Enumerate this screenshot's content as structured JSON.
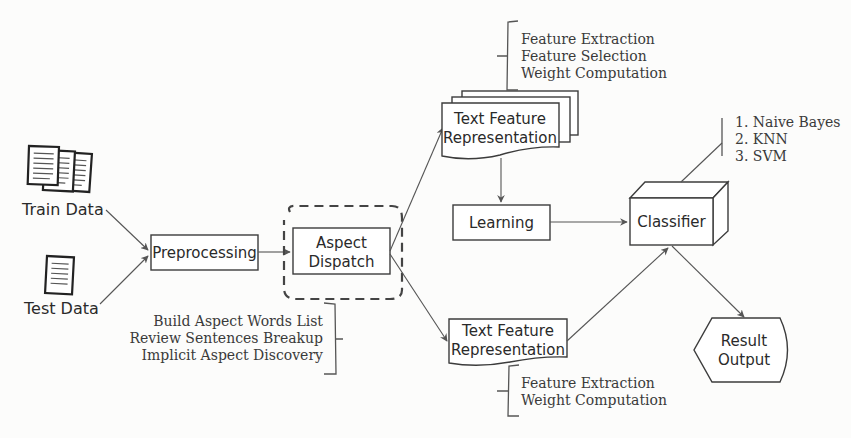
{
  "inputs": {
    "train": {
      "label": "Train Data",
      "icon": "document-stack-icon"
    },
    "test": {
      "label": "Test Data",
      "icon": "document-icon"
    }
  },
  "nodes": {
    "preprocessing": "Preprocessing",
    "aspect_dispatch": {
      "line1": "Aspect",
      "line2": "Dispatch"
    },
    "tfr_train": {
      "line1": "Text Feature",
      "line2": "Representation"
    },
    "tfr_test": {
      "line1": "Text Feature",
      "line2": "Representation"
    },
    "learning": "Learning",
    "classifier": "Classifier",
    "result_output": {
      "line1": "Result",
      "line2": "Output"
    }
  },
  "annotations": {
    "train_features": [
      "Feature Extraction",
      "Feature Selection",
      "Weight Computation"
    ],
    "test_features": [
      "Feature Extraction",
      "Weight Computation"
    ],
    "aspect_steps": [
      "Build Aspect Words List",
      "Review Sentences Breakup",
      "Implicit Aspect Discovery"
    ],
    "classifiers": [
      "1. Naive Bayes",
      "2. KNN",
      "3. SVM"
    ]
  },
  "edges": [
    {
      "from": "Train Data",
      "to": "Preprocessing"
    },
    {
      "from": "Test Data",
      "to": "Preprocessing"
    },
    {
      "from": "Preprocessing",
      "to": "Aspect Dispatch"
    },
    {
      "from": "Aspect Dispatch",
      "to": "Text Feature Representation (train)"
    },
    {
      "from": "Aspect Dispatch",
      "to": "Text Feature Representation (test)"
    },
    {
      "from": "Text Feature Representation (train)",
      "to": "Learning"
    },
    {
      "from": "Learning",
      "to": "Classifier"
    },
    {
      "from": "Text Feature Representation (test)",
      "to": "Classifier"
    },
    {
      "from": "Classifier",
      "to": "Result Output"
    }
  ]
}
